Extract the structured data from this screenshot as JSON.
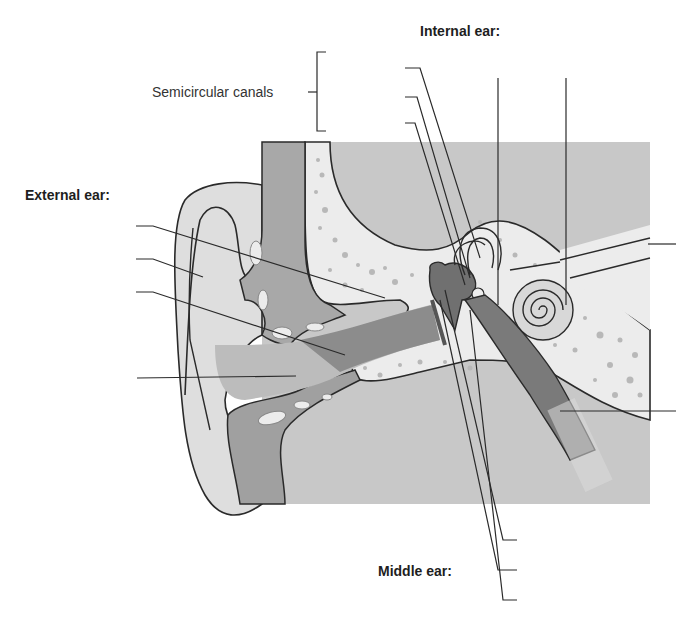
{
  "diagram": {
    "type": "anatomical-ear-cross-section",
    "headings": {
      "internal_ear": "Internal ear:",
      "external_ear": "External ear:",
      "middle_ear": "Middle ear:"
    },
    "labels": {
      "semicircular_canals": "Semicircular canals"
    },
    "blank_label_lines": {
      "external_ear": 4,
      "internal_ear_top": 5,
      "right_side": 2,
      "middle_ear_bottom": 3
    },
    "colors": {
      "background_panel": "#c8c8c8",
      "bone": "#ececec",
      "soft_tissue_dark": "#8a8a8a",
      "canal_mid": "#a8a8a8",
      "auricle": "#dedede",
      "line": "#2a2a2a"
    }
  }
}
